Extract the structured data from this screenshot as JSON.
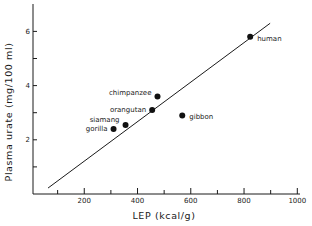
{
  "chart_data": {
    "type": "scatter",
    "title": "",
    "xlabel": "LEP (kcal/g)",
    "ylabel": "Plasma urate (mg/100 ml)",
    "xlim": [
      0,
      1000
    ],
    "ylim": [
      0,
      7
    ],
    "x_ticks": [
      100,
      200,
      300,
      400,
      500,
      600,
      700,
      800,
      900,
      1000
    ],
    "x_tick_labels": [
      {
        "value": 200,
        "label": "200"
      },
      {
        "value": 400,
        "label": "400"
      },
      {
        "value": 600,
        "label": "600"
      },
      {
        "value": 800,
        "label": "800"
      },
      {
        "value": 1000,
        "label": "1000"
      }
    ],
    "y_ticks": [
      1,
      2,
      3,
      4,
      5,
      6
    ],
    "y_tick_labels": [
      {
        "value": 2,
        "label": "2"
      },
      {
        "value": 4,
        "label": "4"
      },
      {
        "value": 6,
        "label": "6"
      }
    ],
    "grid": false,
    "legend": "none",
    "points": [
      {
        "name": "gorilla",
        "x": 310,
        "y": 2.4,
        "label_side": "left"
      },
      {
        "name": "siamang",
        "x": 355,
        "y": 2.55,
        "label_side": "upper-left"
      },
      {
        "name": "orangutan",
        "x": 455,
        "y": 3.1,
        "label_side": "left"
      },
      {
        "name": "chimpanzee",
        "x": 475,
        "y": 3.6,
        "label_side": "left"
      },
      {
        "name": "gibbon",
        "x": 568,
        "y": 2.9,
        "label_side": "right"
      },
      {
        "name": "human",
        "x": 823,
        "y": 5.8,
        "label_side": "right"
      }
    ],
    "fit_line": {
      "x": [
        64,
        898
      ],
      "y": [
        0.22,
        6.3
      ]
    }
  }
}
